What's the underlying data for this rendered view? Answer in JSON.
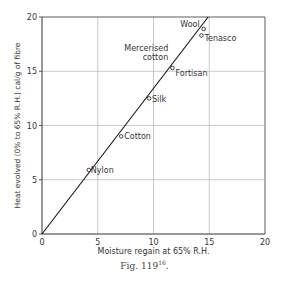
{
  "chart_data": {
    "type": "scatter",
    "title": "",
    "xlabel": "Moisture regain at 65% R.H.",
    "ylabel": "Heat evolved (0% to 65% R.H.) cal/g of fibre",
    "xlim": [
      0,
      20
    ],
    "ylim": [
      0,
      20
    ],
    "x_ticks": [
      0,
      5,
      10,
      15,
      20
    ],
    "y_ticks": [
      0,
      5,
      10,
      15,
      20
    ],
    "grid": true,
    "legend": null,
    "points": [
      {
        "label": "Nylon",
        "x": 4.2,
        "y": 5.9
      },
      {
        "label": "Cotton",
        "x": 7.1,
        "y": 9.0
      },
      {
        "label": "Silk",
        "x": 9.6,
        "y": 12.5
      },
      {
        "label": "Mercerised cotton",
        "x": 11.5,
        "y": 15.0
      },
      {
        "label": "Fortisan",
        "x": 11.7,
        "y": 15.3
      },
      {
        "label": "Tenasco",
        "x": 14.3,
        "y": 18.3
      },
      {
        "label": "Wool",
        "x": 14.5,
        "y": 18.9
      }
    ],
    "fit_line": {
      "x": [
        0,
        14.9
      ],
      "y": [
        0,
        20
      ]
    }
  },
  "caption": {
    "text": "Fig. 119",
    "superscript": "16",
    "suffix": "."
  },
  "colors": {
    "axis": "#333333",
    "grid": "#bbbbbb",
    "line": "#111111",
    "text": "#333333"
  }
}
